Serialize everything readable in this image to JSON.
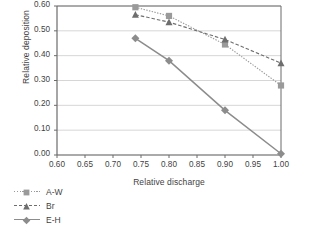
{
  "chart_data": {
    "type": "line",
    "title": "",
    "xlabel": "Relative discharge",
    "ylabel": "Relative deposition",
    "xlim": [
      0.6,
      1.0
    ],
    "ylim": [
      0.0,
      0.6
    ],
    "xticks": [
      "0.60",
      "0.65",
      "0.70",
      "0.75",
      "0.80",
      "0.85",
      "0.90",
      "0.95",
      "1.00"
    ],
    "xtick_values": [
      0.6,
      0.65,
      0.7,
      0.75,
      0.8,
      0.85,
      0.9,
      0.95,
      1.0
    ],
    "yticks": [
      "0.00",
      "0.10",
      "0.20",
      "0.30",
      "0.40",
      "0.50",
      "0.60"
    ],
    "ytick_values": [
      0.0,
      0.1,
      0.2,
      0.3,
      0.4,
      0.5,
      0.6
    ],
    "grid": "horizontal",
    "legend_position": "bottom-left",
    "x": [
      0.74,
      0.8,
      0.9,
      1.0
    ],
    "series": [
      {
        "name": "A-W",
        "values": [
          0.595,
          0.56,
          0.445,
          0.28
        ],
        "marker": "square",
        "linestyle": "dotted",
        "color": "#9a9a9a"
      },
      {
        "name": "Br",
        "values": [
          0.565,
          0.535,
          0.465,
          0.37
        ],
        "marker": "triangle",
        "linestyle": "dashed",
        "color": "#6e6e6e"
      },
      {
        "name": "E-H",
        "values": [
          0.47,
          0.38,
          0.18,
          0.005
        ],
        "marker": "diamond",
        "linestyle": "solid",
        "color": "#8c8c8c"
      }
    ]
  },
  "legend": {
    "items": [
      {
        "label": "A-W"
      },
      {
        "label": "Br"
      },
      {
        "label": "E-H"
      }
    ]
  },
  "colors": {
    "axis": "#6b6b6b",
    "grid": "#d6d6d6",
    "text": "#3f3f3f",
    "series_a_w": "#9a9a9a",
    "series_br": "#6e6e6e",
    "series_e_h": "#8c8c8c"
  }
}
